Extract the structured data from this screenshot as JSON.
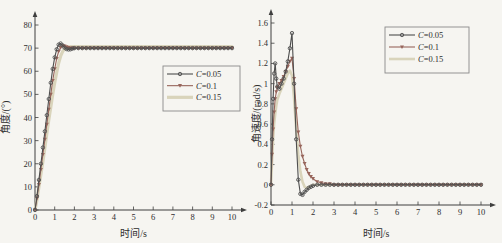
{
  "figure": {
    "background": "#f6f5f1",
    "axis_color": "#3f3f3f",
    "text_color": "#2e2e2e",
    "legend_border_color": "#8a8a8a"
  },
  "chart_data": [
    {
      "type": "line",
      "title": "",
      "xlabel": "时间/s",
      "ylabel": "角度/(°)",
      "xlim": [
        0,
        10
      ],
      "ylim": [
        0,
        80
      ],
      "grid": false,
      "legend_position": "middle-right",
      "xticks": [
        0,
        1,
        2,
        3,
        4,
        5,
        6,
        7,
        8,
        9,
        10
      ],
      "xtick_labels": [
        "0",
        "1",
        "2",
        "3",
        "4",
        "5",
        "6",
        "7",
        "8",
        "9",
        "10"
      ],
      "yticks": [
        0,
        10,
        20,
        30,
        40,
        50,
        60,
        70,
        80
      ],
      "ytick_labels": [
        "0",
        "10",
        "20",
        "30",
        "40",
        "50",
        "60",
        "70",
        "80"
      ],
      "x": [
        0,
        0.1,
        0.2,
        0.3,
        0.4,
        0.5,
        0.6,
        0.7,
        0.8,
        0.9,
        1.0,
        1.1,
        1.2,
        1.3,
        1.4,
        1.5,
        1.6,
        1.7,
        1.8,
        1.9,
        2.0,
        2.2,
        2.4,
        2.6,
        2.8,
        3.0,
        3.2,
        3.4,
        3.6,
        3.8,
        4.0,
        4.2,
        4.4,
        4.6,
        4.8,
        5.0,
        5.2,
        5.4,
        5.6,
        5.8,
        6.0,
        6.2,
        6.4,
        6.6,
        6.8,
        7.0,
        7.2,
        7.4,
        7.6,
        7.8,
        8.0,
        8.2,
        8.4,
        8.6,
        8.8,
        9.0,
        9.2,
        9.4,
        9.6,
        9.8,
        10.0
      ],
      "series": [
        {
          "name": "C=0.05",
          "color": "#4e4e4e",
          "marker": "circle",
          "width": 1.1,
          "y": [
            0,
            6,
            13,
            20,
            27,
            34,
            41,
            48,
            55,
            61,
            66,
            69.5,
            71.5,
            72,
            71.2,
            70.2,
            69.6,
            69.4,
            69.5,
            69.8,
            70,
            70,
            70,
            70,
            70,
            70,
            70,
            70,
            70,
            70,
            70,
            70,
            70,
            70,
            70,
            70,
            70,
            70,
            70,
            70,
            70,
            70,
            70,
            70,
            70,
            70,
            70,
            70,
            70,
            70,
            70,
            70,
            70,
            70,
            70,
            70,
            70,
            70,
            70,
            70,
            70
          ]
        },
        {
          "name": "C=0.1",
          "color": "#97655b",
          "marker": "triangle-down",
          "width": 1.1,
          "y": [
            0,
            5,
            11,
            17.5,
            24,
            30.5,
            37,
            43.5,
            50,
            56,
            61,
            65.5,
            68.5,
            70.2,
            71,
            70.9,
            70.5,
            70.2,
            70,
            70,
            70,
            70,
            70,
            70,
            70,
            70,
            70,
            70,
            70,
            70,
            70,
            70,
            70,
            70,
            70,
            70,
            70,
            70,
            70,
            70,
            70,
            70,
            70,
            70,
            70,
            70,
            70,
            70,
            70,
            70,
            70,
            70,
            70,
            70,
            70,
            70,
            70,
            70,
            70,
            70,
            70
          ]
        },
        {
          "name": "C=0.15",
          "color": "#d9d4bb",
          "marker": "none",
          "width": 3.2,
          "y": [
            0,
            4.5,
            10,
            15.5,
            21,
            27,
            33,
            39,
            44.5,
            50,
            55,
            59.5,
            63.5,
            66.5,
            68.5,
            69.7,
            70.2,
            70.5,
            70.6,
            70.6,
            70.6,
            70.6,
            70.6,
            70.6,
            70.6,
            70.6,
            70.6,
            70.6,
            70.6,
            70.6,
            70.6,
            70.6,
            70.6,
            70.6,
            70.6,
            70.6,
            70.6,
            70.6,
            70.6,
            70.6,
            70.6,
            70.6,
            70.6,
            70.6,
            70.6,
            70.6,
            70.6,
            70.6,
            70.6,
            70.6,
            70.6,
            70.6,
            70.6,
            70.6,
            70.6,
            70.6,
            70.6,
            70.6,
            70.6,
            70.6,
            70.6
          ]
        }
      ]
    },
    {
      "type": "line",
      "title": "",
      "xlabel": "时间/s",
      "ylabel": "角速度/(rad/s)",
      "xlim": [
        0,
        10
      ],
      "ylim": [
        -0.2,
        1.6
      ],
      "grid": false,
      "legend_position": "top-right",
      "xticks": [
        0,
        1,
        2,
        3,
        4,
        5,
        6,
        7,
        8,
        9,
        10
      ],
      "xtick_labels": [
        "0",
        "1",
        "2",
        "3",
        "4",
        "5",
        "6",
        "7",
        "8",
        "9",
        "10"
      ],
      "yticks": [
        -0.2,
        0,
        0.2,
        0.4,
        0.6,
        0.8,
        1,
        1.2,
        1.4,
        1.6
      ],
      "ytick_labels": [
        "-0.2",
        "0",
        "0.2",
        "0.4",
        "0.6",
        "0.8",
        "1",
        "1.2",
        "1.4",
        "1.6"
      ],
      "x": [
        0,
        0.05,
        0.1,
        0.15,
        0.2,
        0.25,
        0.3,
        0.4,
        0.5,
        0.6,
        0.7,
        0.8,
        0.9,
        1.0,
        1.1,
        1.2,
        1.3,
        1.4,
        1.5,
        1.6,
        1.7,
        1.8,
        1.9,
        2.0,
        2.2,
        2.4,
        2.6,
        2.8,
        3.0,
        3.2,
        3.4,
        3.6,
        3.8,
        4.0,
        4.2,
        4.4,
        4.6,
        4.8,
        5.0,
        5.2,
        5.4,
        5.6,
        5.8,
        6.0,
        6.2,
        6.4,
        6.6,
        6.8,
        7.0,
        7.2,
        7.4,
        7.6,
        7.8,
        8.0,
        8.2,
        8.4,
        8.6,
        8.8,
        9.0,
        9.2,
        9.4,
        9.6,
        9.8,
        10.0
      ],
      "series": [
        {
          "name": "C=0.05",
          "color": "#4e4e4e",
          "marker": "circle",
          "width": 1.1,
          "y": [
            0,
            0.45,
            0.85,
            1.1,
            1.2,
            1.05,
            0.97,
            0.95,
            1.0,
            1.05,
            1.12,
            1.22,
            1.35,
            1.5,
            1.0,
            0.45,
            0.05,
            -0.09,
            -0.1,
            -0.07,
            -0.05,
            -0.03,
            -0.02,
            -0.01,
            0,
            0,
            0,
            0,
            0,
            0,
            0,
            0,
            0,
            0,
            0,
            0,
            0,
            0,
            0,
            0,
            0,
            0,
            0,
            0,
            0,
            0,
            0,
            0,
            0,
            0,
            0,
            0,
            0,
            0,
            0,
            0,
            0,
            0,
            0,
            0,
            0,
            0,
            0,
            0
          ]
        },
        {
          "name": "C=0.1",
          "color": "#97655b",
          "marker": "triangle-down",
          "width": 1.1,
          "y": [
            0,
            0.3,
            0.55,
            0.72,
            0.85,
            0.92,
            0.96,
            1.0,
            1.03,
            1.07,
            1.12,
            1.17,
            1.22,
            1.25,
            1.05,
            0.75,
            0.52,
            0.38,
            0.28,
            0.21,
            0.15,
            0.11,
            0.08,
            0.06,
            0.03,
            0.02,
            0.01,
            0.01,
            0,
            0,
            0,
            0,
            0,
            0,
            0,
            0,
            0,
            0,
            0,
            0,
            0,
            0,
            0,
            0,
            0,
            0,
            0,
            0,
            0,
            0,
            0,
            0,
            0,
            0,
            0,
            0,
            0,
            0,
            0,
            0,
            0,
            0,
            0,
            0
          ]
        },
        {
          "name": "C=0.15",
          "color": "#d9d4bb",
          "marker": "none",
          "width": 2.6,
          "y": [
            0,
            0.25,
            0.45,
            0.6,
            0.7,
            0.78,
            0.84,
            0.9,
            0.95,
            1.0,
            1.05,
            1.1,
            1.13,
            1.08,
            0.85,
            0.55,
            0.3,
            0.13,
            0.03,
            -0.02,
            -0.03,
            -0.02,
            -0.01,
            0,
            0,
            0,
            0,
            0,
            0,
            0,
            0,
            0,
            0,
            0,
            0,
            0,
            0,
            0,
            0,
            0,
            0,
            0,
            0,
            0,
            0,
            0,
            0,
            0,
            0,
            0,
            0,
            0,
            0,
            0,
            0,
            0,
            0,
            0,
            0,
            0,
            0,
            0,
            0,
            0
          ]
        }
      ]
    }
  ]
}
